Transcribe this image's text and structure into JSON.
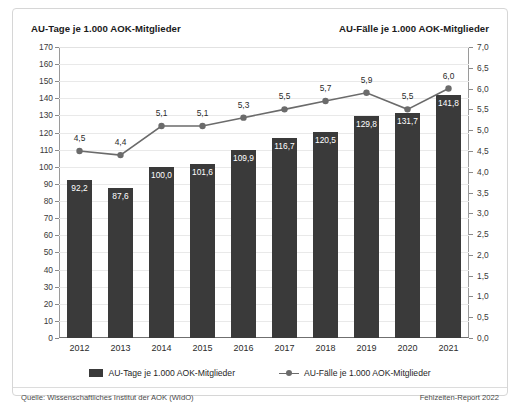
{
  "header": {
    "left_title": "AU-Tage je 1.000 AOK-Mitglieder",
    "right_title": "AU-Fälle je 1.000 AOK-Mitglieder"
  },
  "footer": {
    "source": "Quelle: Wissenschaftliches Institut der AOK (WIdO)",
    "report": "Fehlzeiten-Report 2022"
  },
  "legend": {
    "bar_label": "AU-Tage je 1.000 AOK-Mitglieder",
    "line_label": "AU-Fälle je 1.000 AOK-Mitglieder",
    "bar_color": "#3a3a3a",
    "line_color": "#6b6b6b"
  },
  "chart_data": {
    "type": "bar",
    "title": "AU-Tage je 1.000 AOK-Mitglieder",
    "subtitle": "AU-Fälle je 1.000 AOK-Mitglieder",
    "xlabel": "",
    "ylabel": "AU-Tage je 1.000 AOK-Mitglieder",
    "y2label": "AU-Fälle je 1.000 AOK-Mitglieder",
    "categories": [
      "2012",
      "2013",
      "2014",
      "2015",
      "2016",
      "2017",
      "2018",
      "2019",
      "2020",
      "2021"
    ],
    "ylim": [
      0,
      170
    ],
    "y2lim": [
      0,
      7
    ],
    "grid": true,
    "legend_position": "bottom",
    "yticks": [
      "0",
      "10",
      "20",
      "30",
      "40",
      "50",
      "60",
      "70",
      "80",
      "90",
      "100",
      "110",
      "120",
      "130",
      "140",
      "150",
      "160",
      "170"
    ],
    "y2ticks": [
      "0,0",
      "0,5",
      "1,0",
      "1,5",
      "2,0",
      "2,5",
      "3,0",
      "3,5",
      "4,0",
      "4,5",
      "5,0",
      "5,5",
      "6,0",
      "6,5",
      "7,0"
    ],
    "series": [
      {
        "name": "AU-Tage je 1.000 AOK-Mitglieder",
        "type": "bar",
        "axis": "left",
        "color": "#3a3a3a",
        "values": [
          92.2,
          87.6,
          100.0,
          101.6,
          109.9,
          116.7,
          120.5,
          129.8,
          131.7,
          141.8
        ],
        "labels": [
          "92,2",
          "87,6",
          "100,0",
          "101,6",
          "109,9",
          "116,7",
          "120,5",
          "129,8",
          "131,7",
          "141,8"
        ]
      },
      {
        "name": "AU-Fälle je 1.000 AOK-Mitglieder",
        "type": "line",
        "axis": "right",
        "color": "#6b6b6b",
        "values": [
          4.5,
          4.4,
          5.1,
          5.1,
          5.3,
          5.5,
          5.7,
          5.9,
          5.5,
          6.0
        ],
        "labels": [
          "4,5",
          "4,4",
          "5,1",
          "5,1",
          "5,3",
          "5,5",
          "5,7",
          "5,9",
          "5,5",
          "6,0"
        ]
      }
    ]
  }
}
